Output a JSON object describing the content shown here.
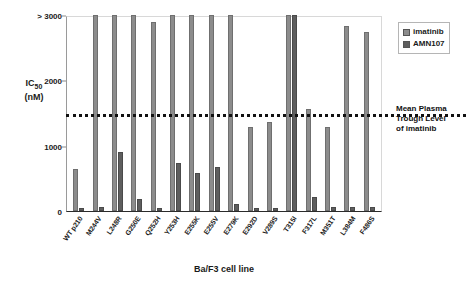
{
  "chart_data": {
    "type": "bar",
    "title": "",
    "xlabel": "Ba/F3 cell line",
    "ylabel": "IC50 (nM)",
    "ylim": [
      0,
      3000
    ],
    "yticks": [
      {
        "value": 0,
        "label": "0"
      },
      {
        "value": 1000,
        "label": "1000"
      },
      {
        "value": 2000,
        "label": "2000"
      },
      {
        "value": 3000,
        "label": "> 3000"
      }
    ],
    "grid": false,
    "legend_position": "top-right",
    "categories": [
      "WT p210",
      "M244V",
      "L248R",
      "G250E",
      "Q252H",
      "Y253H",
      "E255K",
      "E255V",
      "E279K",
      "E292D",
      "V289S",
      "T315I",
      "F317L",
      "M351T",
      "L384M",
      "F486S"
    ],
    "series": [
      {
        "name": "imatinib",
        "color": "#8c8c8c",
        "values": [
          640,
          3000,
          3000,
          3000,
          2890,
          3000,
          3000,
          3000,
          3000,
          1280,
          1370,
          3000,
          1560,
          1290,
          2830,
          2740
        ]
      },
      {
        "name": "AMN107",
        "color": "#5e5e5e",
        "values": [
          40,
          55,
          900,
          185,
          45,
          740,
          580,
          670,
          110,
          45,
          50,
          3000,
          220,
          55,
          60,
          60
        ]
      }
    ],
    "annotations": [
      {
        "name": "threshold-line",
        "value": 1500,
        "style": "dotted",
        "color": "#111111",
        "label": "Mean Plasma Trough Level of imatinib"
      }
    ]
  },
  "axes": {
    "y_title_main": "IC",
    "y_title_sub": "50",
    "y_title_units": "(nM)",
    "x_title": "Ba/F3 cell line"
  },
  "legend": {
    "items": [
      {
        "label": "imatinib",
        "color": "#8c8c8c"
      },
      {
        "label": "AMN107",
        "color": "#5e5e5e"
      }
    ]
  },
  "annotation": {
    "line1": "Mean Plasma",
    "line2": "Trough Level",
    "line3": "of imatinib"
  }
}
